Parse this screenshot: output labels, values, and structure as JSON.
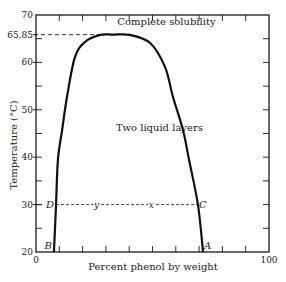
{
  "chart_data": {
    "type": "line",
    "title": "",
    "xlabel": "Percent phenol by weight",
    "ylabel": "Temperature (°C)",
    "xlim": [
      0,
      100
    ],
    "ylim": [
      20,
      70
    ],
    "x_tick_labels": [
      {
        "value": 0,
        "label": "0"
      },
      {
        "value": 100,
        "label": "100"
      }
    ],
    "x_minor_ticks": [
      10,
      20,
      30,
      40,
      50,
      60,
      70,
      80,
      90
    ],
    "y_tick_labels": [
      {
        "value": 20,
        "label": "20"
      },
      {
        "value": 30,
        "label": "30"
      },
      {
        "value": 40,
        "label": "40"
      },
      {
        "value": 50,
        "label": "50"
      },
      {
        "value": 60,
        "label": "60"
      },
      {
        "value": 65.85,
        "label": "65.85"
      },
      {
        "value": 70,
        "label": "70"
      }
    ],
    "y_minor_ticks": [
      25,
      35,
      45,
      55,
      65
    ],
    "grid": false,
    "series": [
      {
        "name": "Solubility curve",
        "x": [
          7.7,
          8.6,
          9.4,
          11.2,
          13.3,
          16.7,
          21.0,
          27.5,
          33.0,
          40.3,
          49.0,
          55.4,
          58.8,
          63.1,
          65.7,
          69.5,
          71.7
        ],
        "y": [
          20,
          30,
          39.4,
          45.7,
          52.7,
          61.1,
          64.3,
          65.8,
          65.85,
          65.8,
          64.1,
          59.0,
          52.7,
          45.7,
          39.4,
          30,
          20
        ]
      }
    ],
    "critical_point": {
      "x": 33.0,
      "y": 65.85
    },
    "tie_line": {
      "temperature": 30,
      "from_x": 8.6,
      "to_x": 69.5,
      "end_labels": [
        "D",
        "C"
      ],
      "inner_points": [
        {
          "label": "y",
          "x": 26
        },
        {
          "label": "x",
          "x": 49.5
        }
      ]
    },
    "base_points": [
      {
        "label": "B",
        "x": 7.7,
        "y": 20
      },
      {
        "label": "A",
        "x": 71.7,
        "y": 20
      }
    ],
    "annotations": [
      {
        "text": "Complete solubility",
        "x": 56,
        "y": 67.8
      },
      {
        "text": "Two liquid layers",
        "x": 53,
        "y": 45.5
      }
    ]
  }
}
